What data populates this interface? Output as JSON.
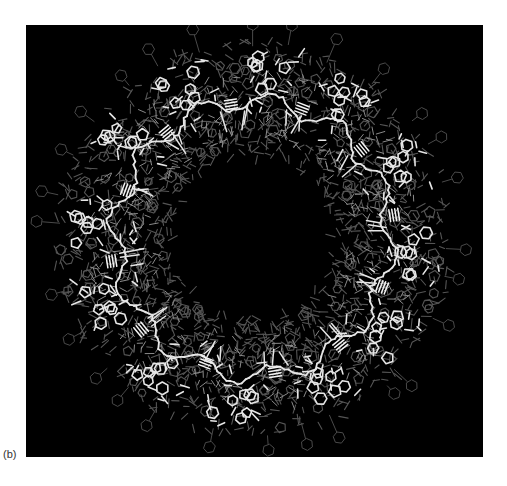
{
  "figure": {
    "panel_label": "(b)",
    "background_color": "#000000",
    "page_color": "#ffffff",
    "foreground_stick_color": "#e6e6e6",
    "background_stick_color": "#555555",
    "mid_stick_color": "#8a8a8a",
    "repeat_units": 12,
    "has_central_pore": true
  }
}
